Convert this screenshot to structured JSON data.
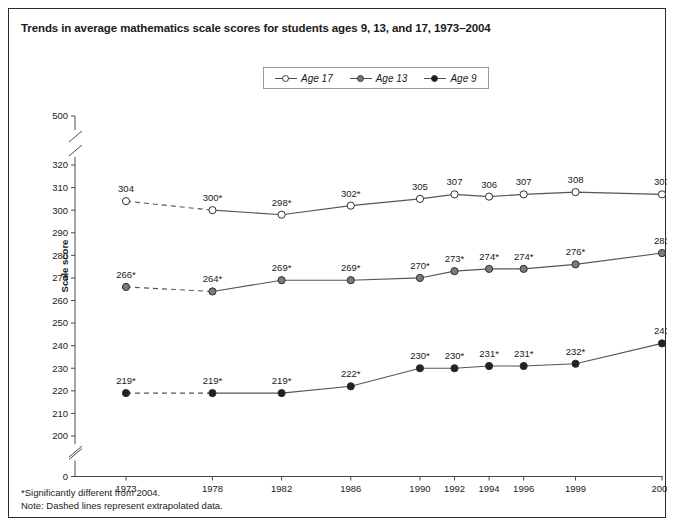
{
  "chart_data": {
    "type": "line",
    "title": "Trends in average mathematics scale scores for students ages 9, 13, and 17, 1973–2004",
    "xlabel": "",
    "ylabel": "Scale score",
    "x": [
      1973,
      1978,
      1982,
      1986,
      1990,
      1992,
      1994,
      1996,
      1999,
      2004
    ],
    "xticklabels": [
      "1973",
      "1978",
      "1982",
      "1986",
      "1990",
      "1992",
      "1994",
      "1996",
      "1999",
      "2004"
    ],
    "yticklabels": [
      "0",
      "200",
      "210",
      "220",
      "230",
      "240",
      "250",
      "260",
      "270",
      "280",
      "290",
      "300",
      "310",
      "320",
      "500"
    ],
    "ylim": [
      200,
      320
    ],
    "y_axis_breaks": [
      "below 200",
      "above 320"
    ],
    "grid": false,
    "legend_position": "top-center",
    "series": [
      {
        "name": "Age 17",
        "marker": "open-circle",
        "values": [
          304,
          300,
          298,
          302,
          305,
          307,
          306,
          307,
          308,
          307
        ],
        "labels": [
          "304",
          "300*",
          "298*",
          "302*",
          "305",
          "307",
          "306",
          "307",
          "308",
          "307"
        ],
        "dashed_segment": [
          1973,
          1978
        ]
      },
      {
        "name": "Age 13",
        "marker": "gray-circle",
        "values": [
          266,
          264,
          269,
          269,
          270,
          273,
          274,
          274,
          276,
          281
        ],
        "labels": [
          "266*",
          "264*",
          "269*",
          "269*",
          "270*",
          "273*",
          "274*",
          "274*",
          "276*",
          "281"
        ],
        "dashed_segment": [
          1973,
          1978
        ]
      },
      {
        "name": "Age 9",
        "marker": "black-circle",
        "values": [
          219,
          219,
          219,
          222,
          230,
          230,
          231,
          231,
          232,
          241
        ],
        "labels": [
          "219*",
          "219*",
          "219*",
          "222*",
          "230*",
          "230*",
          "231*",
          "231*",
          "232*",
          "241"
        ],
        "dashed_segment": [
          1973,
          1978
        ]
      }
    ],
    "annotations": [
      "*Significantly different from 2004.",
      "Note: Dashed lines represent extrapolated data."
    ]
  },
  "legend": {
    "items": [
      {
        "label": "Age 17",
        "marker": "open-circle"
      },
      {
        "label": "Age 13",
        "marker": "gray-circle"
      },
      {
        "label": "Age 9",
        "marker": "black-circle"
      }
    ]
  },
  "footnotes": {
    "significance": "*Significantly different from 2004.",
    "note": "Note: Dashed lines represent extrapolated data."
  },
  "colors": {
    "line": "#555555",
    "age17_marker": "#ffffff",
    "age13_marker": "#7b7b7b",
    "age9_marker": "#222222",
    "axis": "#4a4a4a",
    "border": "#2b2b2b"
  }
}
